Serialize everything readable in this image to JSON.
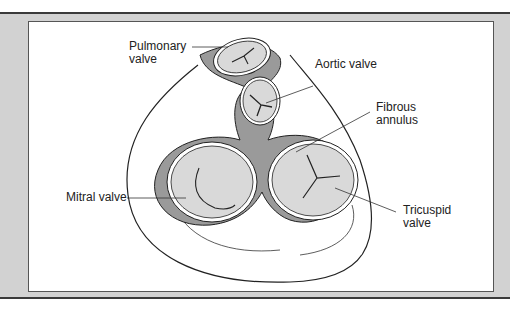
{
  "diagram": {
    "labels": {
      "pulmonary": "Pulmonary\nvalve",
      "aortic": "Aortic valve",
      "fibrous": "Fibrous\nannulus",
      "mitral": "Mitral valve",
      "tricuspid": "Tricuspid\nvalve"
    },
    "colors": {
      "frame": "#d2d2d2",
      "valve_fill": "#d9d9d9",
      "annulus": "#9a9a9a",
      "line": "#222222"
    }
  }
}
